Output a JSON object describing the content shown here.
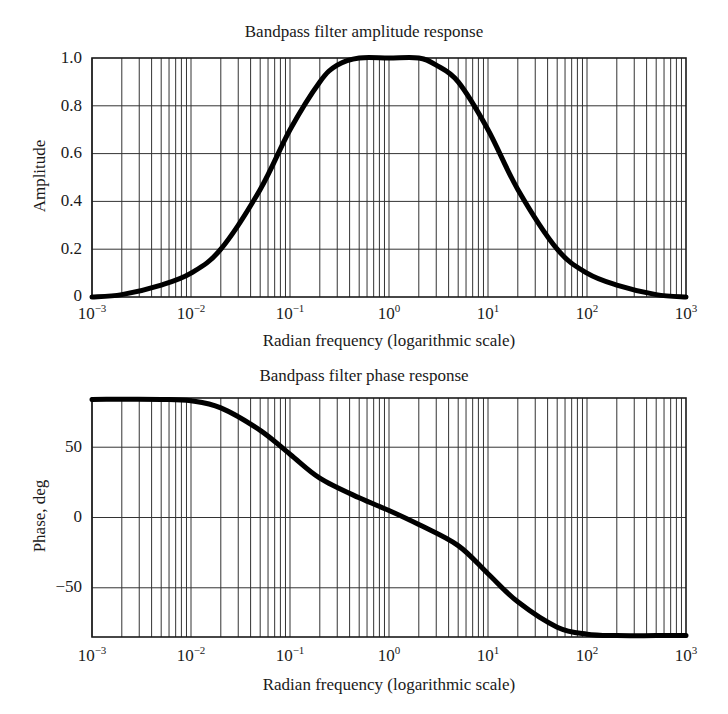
{
  "chart_data": [
    {
      "type": "line",
      "title": "Bandpass filter amplitude response",
      "xlabel": "Radian frequency (logarithmic scale)",
      "ylabel": "Amplitude",
      "xscale": "log",
      "xlim": [
        0.001,
        1000
      ],
      "ylim": [
        0,
        1.0
      ],
      "grid": true,
      "x_tick_labels": [
        "10^-3",
        "10^-2",
        "10^-1",
        "10^0",
        "10^1",
        "10^2",
        "10^3"
      ],
      "y_tick_labels": [
        "0",
        "0.2",
        "0.4",
        "0.6",
        "0.8",
        "1.0"
      ],
      "series": [
        {
          "name": "Amplitude",
          "x": [
            0.001,
            0.002,
            0.005,
            0.01,
            0.02,
            0.05,
            0.1,
            0.2,
            0.3,
            0.5,
            1,
            2,
            3,
            5,
            10,
            20,
            50,
            100,
            200,
            500,
            1000
          ],
          "y": [
            0.0,
            0.01,
            0.05,
            0.1,
            0.2,
            0.45,
            0.7,
            0.9,
            0.97,
            1.0,
            1.0,
            1.0,
            0.97,
            0.9,
            0.7,
            0.45,
            0.2,
            0.1,
            0.05,
            0.01,
            0.0
          ]
        }
      ]
    },
    {
      "type": "line",
      "title": "Bandpass filter phase response",
      "xlabel": "Radian frequency (logarithmic scale)",
      "ylabel": "Phase, deg",
      "xscale": "log",
      "xlim": [
        0.001,
        1000
      ],
      "ylim": [
        -85,
        85
      ],
      "grid": true,
      "x_tick_labels": [
        "10^-3",
        "10^-2",
        "10^-1",
        "10^0",
        "10^1",
        "10^2",
        "10^3"
      ],
      "y_tick_labels": [
        "-50",
        "0",
        "50"
      ],
      "series": [
        {
          "name": "Phase",
          "x": [
            0.001,
            0.005,
            0.01,
            0.02,
            0.05,
            0.1,
            0.2,
            0.5,
            1,
            2,
            5,
            10,
            20,
            50,
            100,
            200,
            500,
            1000
          ],
          "y": [
            84,
            84,
            83,
            78,
            62,
            45,
            28,
            14,
            5,
            -5,
            -20,
            -40,
            -60,
            -78,
            -83,
            -84,
            -84,
            -84
          ]
        }
      ]
    }
  ],
  "amplitude": {
    "title": "Bandpass filter amplitude response",
    "ylabel": "Amplitude",
    "xlabel": "Radian frequency (logarithmic scale)",
    "yticks": [
      "1.0",
      "0.8",
      "0.6",
      "0.4",
      "0.2",
      "0"
    ]
  },
  "phase": {
    "title": "Bandpass filter phase response",
    "ylabel": "Phase, deg",
    "xlabel": "Radian frequency (logarithmic scale)",
    "yticks": [
      "50",
      "0",
      "−50"
    ]
  },
  "xticks": {
    "base": "10",
    "exponents": [
      "−3",
      "−2",
      "−1",
      "0",
      "1",
      "2",
      "3"
    ]
  },
  "colors": {
    "ink": "#1a1a1a",
    "grid": "#333333",
    "background": "#ffffff"
  }
}
